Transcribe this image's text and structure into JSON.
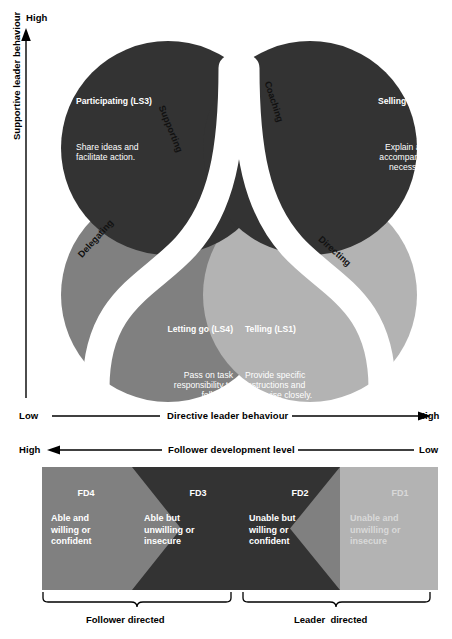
{
  "axes": {
    "vertical": {
      "title": "Supportive leader behaviour",
      "high": "High",
      "low": "Low"
    },
    "horizontal_directive": {
      "title": "Directive leader behaviour",
      "left": "Low",
      "right": "High"
    },
    "horizontal_follower": {
      "title": "Follower development level",
      "left": "High",
      "right": "Low"
    }
  },
  "styles": [
    {
      "id": "ls3",
      "title": "Participating (LS3)",
      "body": "Share ideas and\nfacilitate action.",
      "color": "#333333",
      "text_color": "#ffffff"
    },
    {
      "id": "ls2",
      "title": "Selling (LS2)",
      "body": "Explain and\naccompany if\nnecessary.",
      "color": "#333333",
      "text_color": "#ffffff"
    },
    {
      "id": "ls4",
      "title": "Letting go (LS4)",
      "body": "Pass on task\nresponsibility to\nfollower.",
      "color": "#808080",
      "text_color": "#ffffff"
    },
    {
      "id": "ls1",
      "title": "Telling (LS1)",
      "body": "Provide specific\ninstructions and\nsupervise closely.",
      "color": "#b3b3b3",
      "text_color": "#ffffff"
    }
  ],
  "bands": [
    {
      "id": "supporting",
      "label": "Supporting"
    },
    {
      "id": "coaching",
      "label": "Coaching"
    },
    {
      "id": "delegating",
      "label": "Delegating"
    },
    {
      "id": "directing",
      "label": "Directing"
    }
  ],
  "development_levels": [
    {
      "id": "fd4",
      "label": "FD4",
      "desc": "Able and\nwilling or\nconfident",
      "color": "#808080",
      "text_color": "#ffffff"
    },
    {
      "id": "fd3",
      "label": "FD3",
      "desc": "Able but\nunwilling or\ninsecure",
      "color": "#333333",
      "text_color": "#ffffff"
    },
    {
      "id": "fd2",
      "label": "FD2",
      "desc": "Unable but\nwilling or\nconfident",
      "color": "#333333",
      "text_color": "#ffffff"
    },
    {
      "id": "fd1",
      "label": "FD1",
      "desc": "Unable and\nunwilling or\ninsecure",
      "color": "#b3b3b3",
      "text_color": "#d9d9d9"
    }
  ],
  "braces": [
    {
      "id": "follower-directed",
      "label": "Follower directed"
    },
    {
      "id": "leader-directed",
      "label": "Leader  directed"
    }
  ],
  "palette": {
    "dark": "#333333",
    "mid_gray": "#808080",
    "light_gray": "#b3b3b3",
    "white": "#ffffff",
    "line": "#000000"
  }
}
